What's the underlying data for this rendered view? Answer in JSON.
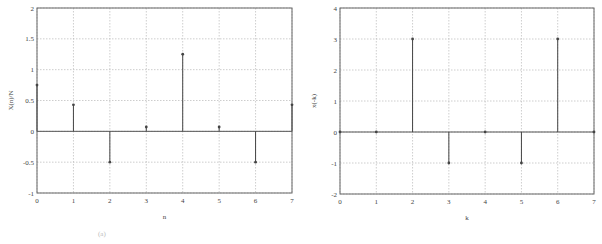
{
  "chart_data": [
    {
      "type": "stem",
      "title": "",
      "xlabel": "n",
      "ylabel": "X(n)/N",
      "xlim": [
        0,
        7
      ],
      "ylim": [
        -1,
        2
      ],
      "grid": true,
      "xticks": [
        "0",
        "1",
        "2",
        "3",
        "4",
        "5",
        "6",
        "7"
      ],
      "yticks": [
        "-1",
        "-0.5",
        "0",
        "0.5",
        "1",
        "1.5",
        "2"
      ],
      "x": [
        0,
        1,
        2,
        3,
        4,
        5,
        6,
        7
      ],
      "values": [
        0.75,
        0.43,
        -0.5,
        0.07,
        1.25,
        0.07,
        -0.5,
        0.43
      ]
    },
    {
      "type": "stem",
      "title": "",
      "xlabel": "k",
      "ylabel": "x(-k)",
      "xlim": [
        0,
        7
      ],
      "ylim": [
        -2,
        4
      ],
      "grid": true,
      "xticks": [
        "0",
        "1",
        "2",
        "3",
        "4",
        "5",
        "6",
        "7"
      ],
      "yticks": [
        "-2",
        "-1",
        "0",
        "1",
        "2",
        "3",
        "4"
      ],
      "x": [
        0,
        1,
        2,
        3,
        4,
        5,
        6,
        7
      ],
      "values": [
        0,
        0,
        3,
        -1,
        0,
        -1,
        3,
        0
      ]
    }
  ],
  "left": {
    "xlabel": "n",
    "ylabel": "X(n)/N"
  },
  "right": {
    "xlabel": "k",
    "ylabel": "x(-k)"
  },
  "caption": "(a)"
}
